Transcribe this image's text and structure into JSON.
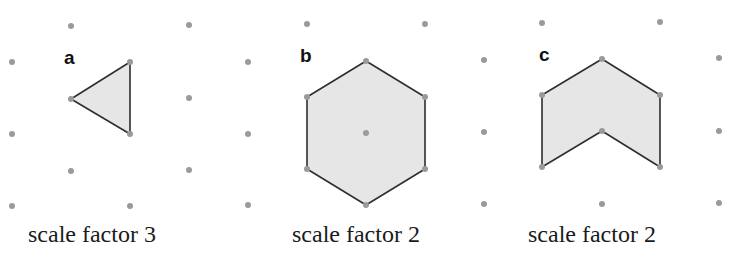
{
  "colors": {
    "dot": "#9a9a9a",
    "fill": "#e6e6e6",
    "stroke": "#2e2e2e"
  },
  "panels": [
    {
      "label": "a",
      "caption": "scale factor 3",
      "shape": "triangle",
      "vertices": [
        [
          71,
          99
        ],
        [
          130,
          62
        ],
        [
          130,
          134
        ]
      ],
      "dots": [
        [
          12,
          62
        ],
        [
          12,
          134
        ],
        [
          12,
          206
        ],
        [
          71,
          26
        ],
        [
          71,
          99
        ],
        [
          71,
          171
        ],
        [
          130,
          62
        ],
        [
          130,
          134
        ],
        [
          130,
          206
        ],
        [
          189,
          25
        ],
        [
          189,
          98
        ],
        [
          189,
          170
        ]
      ]
    },
    {
      "label": "b",
      "caption": "scale factor 2",
      "shape": "hexagon",
      "vertices": [
        [
          366,
          61
        ],
        [
          425,
          97
        ],
        [
          425,
          169
        ],
        [
          366,
          205
        ],
        [
          307,
          169
        ],
        [
          307,
          97
        ]
      ],
      "dots": [
        [
          248,
          62
        ],
        [
          248,
          134
        ],
        [
          248,
          205
        ],
        [
          307,
          24
        ],
        [
          307,
          97
        ],
        [
          307,
          169
        ],
        [
          366,
          61
        ],
        [
          366,
          133
        ],
        [
          366,
          205
        ],
        [
          425,
          24
        ],
        [
          425,
          97
        ],
        [
          425,
          169
        ]
      ]
    },
    {
      "label": "c",
      "caption": "scale factor 2",
      "shape": "chevron",
      "vertices": [
        [
          602,
          59
        ],
        [
          660,
          95
        ],
        [
          660,
          167
        ],
        [
          602,
          131
        ],
        [
          542,
          167
        ],
        [
          542,
          95
        ]
      ],
      "dots": [
        [
          484,
          60
        ],
        [
          484,
          132
        ],
        [
          484,
          204
        ],
        [
          542,
          23
        ],
        [
          542,
          95
        ],
        [
          542,
          167
        ],
        [
          602,
          59
        ],
        [
          602,
          131
        ],
        [
          602,
          204
        ],
        [
          660,
          22
        ],
        [
          660,
          95
        ],
        [
          660,
          167
        ],
        [
          719,
          58
        ],
        [
          719,
          131
        ],
        [
          719,
          203
        ]
      ]
    }
  ]
}
